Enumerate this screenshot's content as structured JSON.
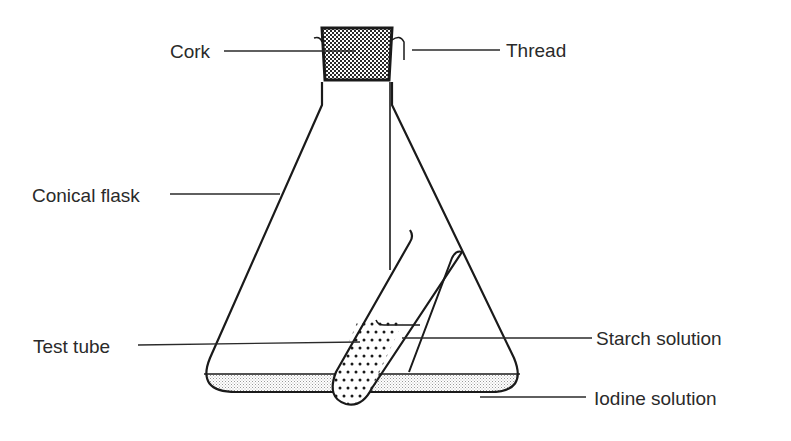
{
  "diagram": {
    "labels": {
      "cork": "Cork",
      "thread": "Thread",
      "conical_flask": "Conical flask",
      "test_tube": "Test tube",
      "starch_solution": "Starch solution",
      "iodine_solution": "Iodine solution"
    },
    "colors": {
      "line": "#1a1a1a",
      "label_text": "#2a2a2a",
      "cork_fill": "#3a3a3a",
      "iodine_fill": "#d8d8d8",
      "background": "#ffffff"
    }
  }
}
